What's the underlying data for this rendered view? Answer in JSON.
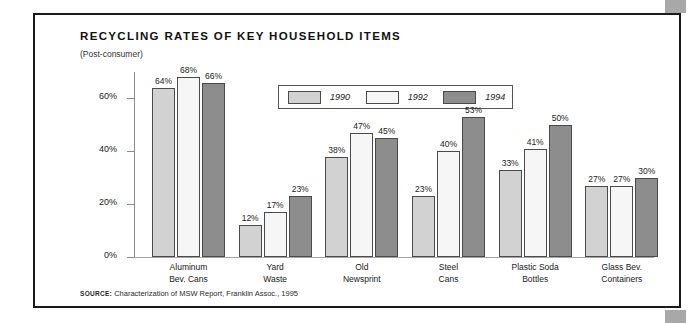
{
  "figure": {
    "title": "RECYCLING RATES OF KEY HOUSEHOLD ITEMS",
    "subtitle": "(Post-consumer)",
    "source_label": "SOURCE:",
    "source_text": "Characterization of MSW Report, Franklin Assoc., 1995"
  },
  "colors": {
    "series_1990": "#d2d2d2",
    "series_1992": "#f6f6f6",
    "series_1994": "#8d8d8d",
    "bar_outline": "#4a4a4a",
    "axis": "#8c8c8c",
    "frame": "#1a1a1a",
    "page_edge_block": "#a8a8a8"
  },
  "chart_data": {
    "type": "bar",
    "title": "RECYCLING RATES OF KEY HOUSEHOLD ITEMS",
    "subtitle": "(Post-consumer)",
    "xlabel": "",
    "ylabel": "",
    "ylim": [
      0,
      70
    ],
    "yticks": [
      0,
      20,
      40,
      60
    ],
    "ytick_labels": [
      "0%",
      "20%",
      "40%",
      "60%"
    ],
    "grid": false,
    "legend_position": "top-center",
    "value_label_suffix": "%",
    "categories": [
      "Aluminum\nBev. Cans",
      "Yard\nWaste",
      "Old\nNewsprint",
      "Steel\nCans",
      "Plastic Soda\nBottles",
      "Glass Bev.\nContainers"
    ],
    "category_lines": [
      [
        "Aluminum",
        "Bev. Cans"
      ],
      [
        "Yard",
        "Waste"
      ],
      [
        "Old",
        "Newsprint"
      ],
      [
        "Steel",
        "Cans"
      ],
      [
        "Plastic Soda",
        "Bottles"
      ],
      [
        "Glass Bev.",
        "Containers"
      ]
    ],
    "series": [
      {
        "name": "1990",
        "color": "#d2d2d2",
        "values": [
          64,
          12,
          38,
          23,
          33,
          27
        ],
        "labels": [
          "64%",
          "12%",
          "38%",
          "23%",
          "33%",
          "27%"
        ]
      },
      {
        "name": "1992",
        "color": "#f6f6f6",
        "values": [
          68,
          17,
          47,
          40,
          41,
          27
        ],
        "labels": [
          "68%",
          "17%",
          "47%",
          "40%",
          "41%",
          "27%"
        ]
      },
      {
        "name": "1994",
        "color": "#8d8d8d",
        "values": [
          66,
          23,
          45,
          53,
          50,
          30
        ],
        "labels": [
          "66%",
          "23%",
          "45%",
          "53%",
          "50%",
          "30%"
        ]
      }
    ]
  }
}
